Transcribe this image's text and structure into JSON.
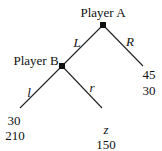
{
  "tree": {
    "nodes": [
      {
        "id": "A",
        "label": "Player A"
      },
      {
        "id": "B",
        "label": "Player B"
      }
    ],
    "edges": [
      {
        "from": "A",
        "to": "B",
        "label": "L"
      },
      {
        "from": "A",
        "to": "leafR",
        "label": "R"
      },
      {
        "from": "B",
        "to": "leafl",
        "label": "l"
      },
      {
        "from": "B",
        "to": "leafr",
        "label": "r"
      }
    ],
    "payoffs": {
      "R": {
        "top": "45",
        "bottom": "30"
      },
      "l": {
        "top": "30",
        "bottom": "210"
      },
      "r": {
        "top": "z",
        "bottom": "150"
      }
    }
  }
}
